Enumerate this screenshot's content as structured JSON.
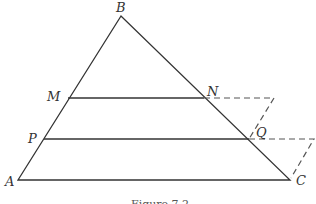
{
  "figure": {
    "caption": "Figure 7.2",
    "labels": {
      "A": "A",
      "B": "B",
      "C": "C",
      "M": "M",
      "N": "N",
      "P": "P",
      "Q": "Q"
    },
    "stroke_color": "#333333",
    "dash_color": "#555555"
  }
}
